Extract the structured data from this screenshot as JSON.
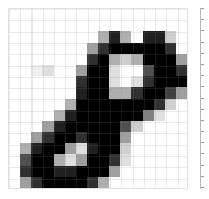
{
  "figure": {
    "title": "",
    "background_color": "#ffffff",
    "width": 209,
    "height": 199
  },
  "axes": {
    "name": "digit-image-axes",
    "border_color": "#e2e2e2",
    "grid_visible": true,
    "grid_color": "#828282",
    "xlabel": "",
    "ylabel": "",
    "xticklabels": [],
    "yticklabels": []
  },
  "colorbar": {
    "name": "intensity-colorbar",
    "visible": true,
    "orientation": "vertical",
    "edge_color": "#b8b8b8",
    "ticklabels": [],
    "tick_count": 17
  },
  "chart_data": {
    "type": "heatmap",
    "title": "",
    "xlabel": "",
    "ylabel": "",
    "colormap": "gray_r",
    "vmin": 0,
    "vmax": 16,
    "grid": true,
    "legend": "none",
    "rows": 16,
    "cols": 16,
    "x": [
      0,
      1,
      2,
      3,
      4,
      5,
      6,
      7,
      8,
      9,
      10,
      11,
      12,
      13,
      14,
      15
    ],
    "y": [
      0,
      1,
      2,
      3,
      4,
      5,
      6,
      7,
      8,
      9,
      10,
      11,
      12,
      13,
      14,
      15
    ],
    "values": [
      [
        0,
        0,
        0,
        0,
        0,
        0,
        0,
        0,
        0,
        0,
        0,
        0,
        0,
        0,
        0,
        0
      ],
      [
        0,
        0,
        0,
        0,
        0,
        0,
        0,
        0,
        0,
        0,
        0,
        0,
        0,
        0,
        0,
        0
      ],
      [
        0,
        0,
        0,
        0,
        0,
        0,
        0,
        0,
        5,
        14,
        5,
        0,
        14,
        14,
        3,
        0
      ],
      [
        0,
        0,
        0,
        0,
        0,
        0,
        0,
        6,
        13,
        16,
        16,
        16,
        16,
        16,
        13,
        0
      ],
      [
        0,
        0,
        0,
        0,
        0,
        0,
        0,
        13,
        16,
        5,
        3,
        5,
        16,
        16,
        16,
        6
      ],
      [
        0,
        0,
        1,
        2,
        0,
        0,
        6,
        16,
        16,
        2,
        0,
        0,
        11,
        16,
        16,
        13
      ],
      [
        0,
        0,
        0,
        0,
        0,
        0,
        13,
        16,
        16,
        2,
        0,
        2,
        13,
        16,
        16,
        16
      ],
      [
        0,
        0,
        0,
        0,
        0,
        0,
        14,
        16,
        16,
        5,
        5,
        13,
        16,
        16,
        12,
        6
      ],
      [
        0,
        0,
        0,
        0,
        0,
        5,
        16,
        16,
        16,
        16,
        16,
        16,
        16,
        13,
        3,
        0
      ],
      [
        0,
        0,
        0,
        0,
        5,
        14,
        16,
        16,
        16,
        16,
        16,
        16,
        8,
        2,
        0,
        0
      ],
      [
        0,
        0,
        0,
        6,
        14,
        16,
        16,
        16,
        16,
        16,
        11,
        3,
        0,
        0,
        0,
        0
      ],
      [
        0,
        0,
        6,
        13,
        16,
        16,
        13,
        16,
        16,
        16,
        6,
        0,
        0,
        0,
        0,
        0
      ],
      [
        0,
        5,
        14,
        16,
        16,
        6,
        2,
        14,
        16,
        16,
        3,
        0,
        0,
        0,
        0,
        0
      ],
      [
        0,
        11,
        16,
        16,
        5,
        2,
        6,
        16,
        16,
        13,
        2,
        0,
        0,
        0,
        0,
        0
      ],
      [
        0,
        13,
        16,
        16,
        14,
        14,
        16,
        16,
        16,
        6,
        0,
        0,
        0,
        0,
        0,
        0
      ],
      [
        0,
        6,
        13,
        16,
        16,
        16,
        16,
        13,
        5,
        0,
        0,
        0,
        0,
        0,
        0,
        0
      ]
    ]
  }
}
